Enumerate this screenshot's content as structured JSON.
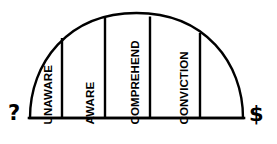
{
  "diagram": {
    "type": "segmented-arch",
    "stroke_color": "#000000",
    "fill_color": "#ffffff",
    "background_color": "#ffffff",
    "baseline_y": 118,
    "arch_left_x": 30,
    "arch_right_x": 243,
    "arch_apex_y": 13,
    "endpoints": {
      "left": {
        "symbol": "?",
        "name": "question-mark"
      },
      "right": {
        "symbol": "$",
        "name": "dollar-sign"
      }
    },
    "dividers": [
      {
        "x": 62,
        "top_y": 38
      },
      {
        "x": 105,
        "top_y": 17
      },
      {
        "x": 150,
        "top_y": 16
      },
      {
        "x": 200,
        "top_y": 33
      }
    ],
    "segments": [
      {
        "index": 0,
        "label": "UNAWARE",
        "label_x": 54,
        "label_baseline_y": 113
      },
      {
        "index": 1,
        "label": "AWARE",
        "label_x": 96,
        "label_baseline_y": 113
      },
      {
        "index": 2,
        "label": "COMPREHEND",
        "label_x": 141,
        "label_baseline_y": 113
      },
      {
        "index": 3,
        "label": "CONVICTION",
        "label_x": 190,
        "label_baseline_y": 113
      },
      {
        "index": 4,
        "label": "",
        "label_x": 0,
        "label_baseline_y": 0
      }
    ]
  }
}
